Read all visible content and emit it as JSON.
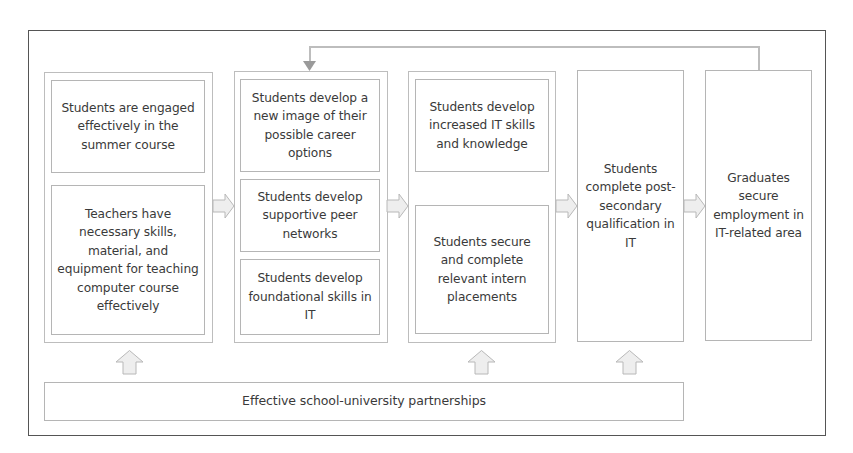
{
  "diagram": {
    "type": "logic-model-flowchart",
    "colors": {
      "outer_border": "#555555",
      "box_border": "#b5b5b5",
      "arrow_fill": "#eeeeee",
      "arrow_stroke": "#b8b8b8",
      "text": "#3a3a3a"
    },
    "columns": [
      {
        "id": "inputs",
        "boxes": [
          {
            "text": "Students are engaged effectively in the summer course"
          },
          {
            "text": "Teachers have necessary skills, material, and equipment for teaching computer course effectively"
          }
        ]
      },
      {
        "id": "short-term",
        "boxes": [
          {
            "text": "Students develop a new image of their possible career options"
          },
          {
            "text": "Students develop supportive peer networks"
          },
          {
            "text": "Students develop foundational skills in IT"
          }
        ]
      },
      {
        "id": "medium-term",
        "boxes": [
          {
            "text": "Students develop increased IT skills and knowledge"
          },
          {
            "text": "Students secure and complete relevant intern placements"
          }
        ]
      },
      {
        "id": "qualification",
        "boxes": [
          {
            "text": "Students complete post-secondary qualification in IT"
          }
        ]
      },
      {
        "id": "employment",
        "boxes": [
          {
            "text": "Graduates secure employment in IT-related area"
          }
        ]
      }
    ],
    "foundation": {
      "text": "Effective school-university partnerships"
    },
    "edges": [
      {
        "from": "inputs",
        "to": "short-term",
        "style": "block-arrow-right"
      },
      {
        "from": "short-term",
        "to": "medium-term",
        "style": "block-arrow-right"
      },
      {
        "from": "medium-term",
        "to": "qualification",
        "style": "block-arrow-right"
      },
      {
        "from": "qualification",
        "to": "employment",
        "style": "block-arrow-right"
      },
      {
        "from": "employment",
        "to": "short-term",
        "style": "feedback-line"
      },
      {
        "from": "foundation",
        "to": "inputs",
        "style": "block-arrow-up"
      },
      {
        "from": "foundation",
        "to": "medium-term",
        "style": "block-arrow-up"
      },
      {
        "from": "foundation",
        "to": "qualification",
        "style": "block-arrow-up"
      }
    ]
  }
}
